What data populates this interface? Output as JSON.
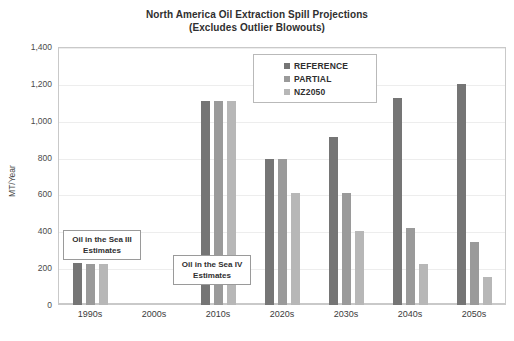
{
  "chart_data": {
    "type": "bar",
    "title": "North America Oil Extraction Spill Projections",
    "subtitle": "(Excludes Outlier Blowouts)",
    "xlabel": "",
    "ylabel": "MT/Year",
    "ylim": [
      0,
      1400
    ],
    "ytick_step": 200,
    "yticks": [
      "0",
      "200",
      "400",
      "600",
      "800",
      "1,000",
      "1,200",
      "1,400"
    ],
    "ytick_values": [
      0,
      200,
      400,
      600,
      800,
      1000,
      1200,
      1400
    ],
    "grid": true,
    "legend_position": "top-center",
    "categories": [
      "1990s",
      "2000s",
      "2010s",
      "2020s",
      "2030s",
      "2040s",
      "2050s"
    ],
    "series": [
      {
        "name": "REFERENCE",
        "color": "#757575",
        "values": [
          230,
          null,
          1105,
          790,
          910,
          1125,
          1200
        ]
      },
      {
        "name": "PARTIAL",
        "color": "#9a9a9a",
        "values": [
          225,
          null,
          1105,
          790,
          610,
          420,
          340
        ]
      },
      {
        "name": "NZ2050",
        "color": "#b7b7b7",
        "values": [
          220,
          null,
          1105,
          610,
          400,
          220,
          150
        ]
      }
    ],
    "annotations": [
      {
        "id": "sea3",
        "text": "Oil in the Sea III Estimates",
        "line1": "Oil in the Sea III",
        "line2": "Estimates"
      },
      {
        "id": "sea4",
        "text": "Oil in the Sea IV Estimates",
        "line1": "Oil in the Sea IV",
        "line2": "Estimates"
      }
    ]
  },
  "colors": {
    "reference": "#757575",
    "partial": "#9a9a9a",
    "nz2050": "#b7b7b7",
    "grid": "#ededed",
    "frame": "#c9c9c9",
    "text": "#3b3b3b"
  },
  "legend": {
    "items": [
      {
        "label": "REFERENCE",
        "color": "#757575"
      },
      {
        "label": "PARTIAL",
        "color": "#9a9a9a"
      },
      {
        "label": "NZ2050",
        "color": "#b7b7b7"
      }
    ]
  },
  "bottom_caption": ""
}
